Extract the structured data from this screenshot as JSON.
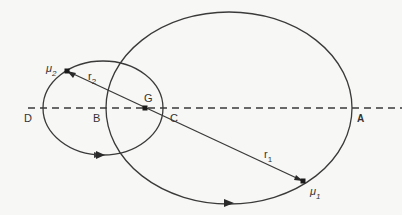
{
  "diagram": {
    "colors": {
      "background": "#f7f7f5",
      "stroke": "#3a3a3a",
      "text": "#333333"
    },
    "labels": {
      "D": "D",
      "B": "B",
      "G": "G",
      "C": "C",
      "A": "A",
      "mu2": "μ",
      "mu2_sub": "2",
      "mu1": "μ",
      "mu1_sub": "1",
      "r2": "r",
      "r2_sub": "2",
      "r1": "r",
      "r1_sub": "1"
    },
    "elements": {
      "axis_line": {
        "style": "dashed",
        "y": 108,
        "x_start": 28,
        "x_end": 402
      },
      "small_orbit": {
        "cx": 103,
        "cy": 108,
        "rx": 60,
        "ry": 47,
        "body": "μ2"
      },
      "large_orbit": {
        "cx": 229,
        "cy": 108,
        "rx": 123,
        "ry": 96,
        "body": "μ1"
      },
      "centre_of_mass": {
        "name": "G",
        "x": 145,
        "y": 108
      },
      "body_mu2": {
        "x": 67,
        "y": 71
      },
      "body_mu1": {
        "x": 303,
        "y": 181
      }
    }
  }
}
